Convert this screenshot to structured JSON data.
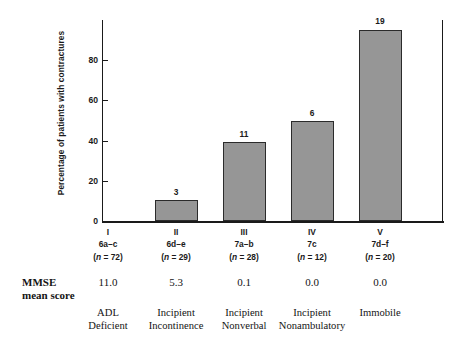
{
  "chart_data": {
    "type": "bar",
    "title": "",
    "xlabel": "",
    "ylabel": "Percentage of patients with contractures",
    "ylim": [
      0,
      100
    ],
    "yticks": [
      "0",
      "20",
      "40",
      "60",
      "80"
    ],
    "ytick_values": [
      0,
      20,
      40,
      60,
      80
    ],
    "grid": false,
    "legend": "none",
    "bar_color": "#969696",
    "bar_edge_color": "#2b2b2b",
    "categories": [
      "I",
      "II",
      "III",
      "IV",
      "V"
    ],
    "values": [
      0,
      10.3,
      39.3,
      50.0,
      95.0
    ],
    "data_labels": [
      "",
      "3",
      "11",
      "6",
      "19"
    ],
    "stage_codes": [
      "6a–c",
      "6d–e",
      "7a–b",
      "7c",
      "7d–f"
    ],
    "n_labels": [
      "(n = 72)",
      "(n = 29)",
      "(n = 28)",
      "(n = 12)",
      "(n = 20)"
    ],
    "n_values": [
      72,
      29,
      28,
      12,
      20
    ],
    "contracture_counts": [
      0,
      3,
      11,
      6,
      19
    ],
    "mmse_row_label_line1": "MMSE",
    "mmse_row_label_line2": "mean score",
    "mmse_mean_scores": [
      "11.0",
      "5.3",
      "0.1",
      "0.0",
      "0.0"
    ],
    "category_descriptions": [
      [
        "ADL",
        "Deficient"
      ],
      [
        "Incipient",
        "Incontinence"
      ],
      [
        "Incipient",
        "Nonverbal"
      ],
      [
        "Incipient",
        "Nonambulatory"
      ],
      [
        "Immobile",
        ""
      ]
    ]
  }
}
